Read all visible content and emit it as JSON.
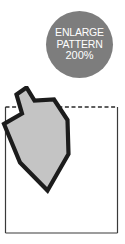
{
  "page": {
    "background_color": "#ffffff",
    "width": 125,
    "height": 244
  },
  "badge": {
    "name": "enlarge-pattern-badge",
    "shape": "circle",
    "fill_color": "#7d7d7d",
    "text_color": "#ffffff",
    "line1": "ENLARGE",
    "line2": "PATTERN",
    "line3": "200%"
  },
  "pattern": {
    "frame": {
      "name": "pattern-frame",
      "stroke_color": "#3a3a3a",
      "fill_color": "#ffffff",
      "top_edge_style": "dashed",
      "side_edge_style": "solid"
    },
    "piece": {
      "name": "dreidel-pattern-piece",
      "fill_color": "#c4c4c4",
      "stroke_color": "#1c1c1c",
      "description": "dreidel outline"
    }
  }
}
